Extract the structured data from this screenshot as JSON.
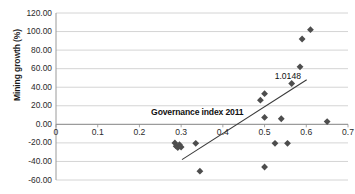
{
  "chart_data": {
    "type": "scatter",
    "title": "",
    "subtitle": "",
    "xlabel": "Governance index 2011",
    "ylabel": "Mining growth (%)",
    "xlim": [
      0,
      0.7
    ],
    "ylim": [
      -60,
      120
    ],
    "grid": true,
    "grid_axis": "y",
    "legend": false,
    "legend_position": "none",
    "marker": "diamond",
    "marker_color": "#4d4d4d",
    "xticks": [
      "0",
      "0.1",
      "0.2",
      "0.3",
      "0.4",
      "0.5",
      "0.6",
      "0.7"
    ],
    "xtick_values": [
      0,
      0.1,
      0.2,
      0.3,
      0.4,
      0.5,
      0.6,
      0.7
    ],
    "yticks": [
      "120.00",
      "100.00",
      "80.00",
      "60.00",
      "40.00",
      "20.00",
      "0.00",
      "-20.00",
      "-40.00",
      "-60.00"
    ],
    "ytick_values": [
      120,
      100,
      80,
      60,
      40,
      20,
      0,
      -20,
      -40,
      -60
    ],
    "points": [
      {
        "x": 0.285,
        "y": -20.0
      },
      {
        "x": 0.288,
        "y": -23.5
      },
      {
        "x": 0.292,
        "y": -25.0
      },
      {
        "x": 0.296,
        "y": -22.0
      },
      {
        "x": 0.3,
        "y": -24.5
      },
      {
        "x": 0.335,
        "y": -20.5
      },
      {
        "x": 0.345,
        "y": -50.5
      },
      {
        "x": 0.49,
        "y": 26.0
      },
      {
        "x": 0.5,
        "y": 33.0
      },
      {
        "x": 0.5,
        "y": 7.5
      },
      {
        "x": 0.5,
        "y": -46.0
      },
      {
        "x": 0.525,
        "y": -20.5
      },
      {
        "x": 0.54,
        "y": 6.0
      },
      {
        "x": 0.555,
        "y": -20.5
      },
      {
        "x": 0.565,
        "y": 44.0
      },
      {
        "x": 0.585,
        "y": 62.0
      },
      {
        "x": 0.59,
        "y": 92.0
      },
      {
        "x": 0.61,
        "y": 102.0
      },
      {
        "x": 0.65,
        "y": 3.0
      }
    ],
    "trendline": {
      "type": "linear",
      "x_start": 0.302,
      "y_start": -38.0,
      "x_end": 0.601,
      "y_end": 48.0,
      "color": "#3a3a3a"
    },
    "annotations": [
      {
        "text": "1.0148",
        "x": 0.565,
        "y": 52.0,
        "name": "slope-annotation"
      }
    ]
  },
  "axis": {
    "x_title": "Governance index 2011",
    "y_title": "Mining growth (%)"
  }
}
